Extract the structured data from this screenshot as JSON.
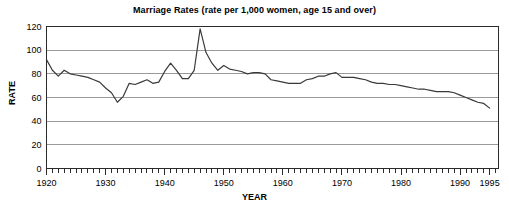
{
  "chart_data": {
    "type": "line",
    "title": "Marriage Rates (rate per 1,000 women, age 15 and over)",
    "xlabel": "YEAR",
    "ylabel": "RATE",
    "xlim": [
      1920,
      1996.5
    ],
    "ylim": [
      0,
      120
    ],
    "yticks": [
      0,
      20,
      40,
      60,
      80,
      100,
      120
    ],
    "xticks": [
      1920,
      1930,
      1940,
      1950,
      1960,
      1970,
      1980,
      1990,
      1995
    ],
    "xtick_labels": [
      "1920",
      "1930",
      "1940",
      "1950",
      "1960",
      "1970",
      "1980",
      "1990",
      "1995"
    ],
    "minor_tick_interval": 1,
    "grid": "horizontal",
    "legend": "none",
    "line_color": "#3a3a3a",
    "grid_color": "#9a9a9a",
    "frame_color": "#2b2b2b",
    "series": [
      {
        "name": "Marriage rate",
        "x": [
          1920,
          1921,
          1922,
          1923,
          1924,
          1925,
          1926,
          1927,
          1928,
          1929,
          1930,
          1931,
          1932,
          1933,
          1934,
          1935,
          1936,
          1937,
          1938,
          1939,
          1940,
          1941,
          1942,
          1943,
          1944,
          1945,
          1946,
          1947,
          1948,
          1949,
          1950,
          1951,
          1952,
          1953,
          1954,
          1955,
          1956,
          1957,
          1958,
          1959,
          1960,
          1961,
          1962,
          1963,
          1964,
          1965,
          1966,
          1967,
          1968,
          1969,
          1970,
          1971,
          1972,
          1973,
          1974,
          1975,
          1976,
          1977,
          1978,
          1979,
          1980,
          1981,
          1982,
          1983,
          1984,
          1985,
          1986,
          1987,
          1988,
          1989,
          1990,
          1991,
          1992,
          1993,
          1994,
          1995
        ],
        "values": [
          92,
          83,
          78,
          83,
          80,
          79,
          78,
          77,
          75,
          73,
          68,
          64,
          56,
          61,
          72,
          71,
          73,
          75,
          72,
          73,
          82,
          89,
          83,
          76,
          76,
          83,
          118,
          98,
          89,
          83,
          87,
          84,
          83,
          82,
          80,
          81,
          81,
          80,
          75,
          74,
          73,
          72,
          72,
          72,
          75,
          76,
          78,
          78,
          80,
          81,
          77,
          77,
          77,
          76,
          75,
          73,
          72,
          72,
          71,
          71,
          70,
          69,
          68,
          67,
          67,
          66,
          65,
          65,
          65,
          64,
          62,
          60,
          58,
          56,
          55,
          51
        ]
      }
    ]
  }
}
